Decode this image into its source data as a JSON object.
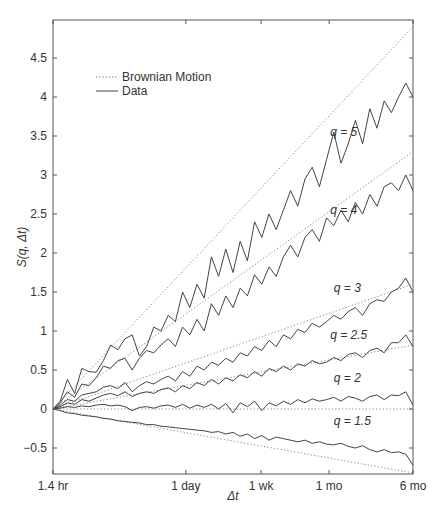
{
  "chart_data": {
    "type": "line",
    "title": "",
    "xlabel": "Δt",
    "ylabel": "S(q, Δt)",
    "xscale": "log",
    "xticks": [
      {
        "label": "1.4 hr",
        "pos": 0.0
      },
      {
        "label": "1 day",
        "pos": 0.369
      },
      {
        "label": "1 wk",
        "pos": 0.578
      },
      {
        "label": "1 mo",
        "pos": 0.767
      },
      {
        "label": "6 mo",
        "pos": 1.0
      }
    ],
    "yticks": [
      -0.5,
      0,
      0.5,
      1,
      1.5,
      2,
      2.5,
      3,
      3.5,
      4,
      4.5
    ],
    "ylim": [
      -0.83,
      4.95
    ],
    "grid": false,
    "legend": {
      "position": "upper left",
      "entries": [
        {
          "label": "Brownian Motion",
          "style": "dotted"
        },
        {
          "label": "Data",
          "style": "solid"
        }
      ]
    },
    "brownian_motion": [
      {
        "q": 5,
        "end": 4.9
      },
      {
        "q": 4,
        "end": 3.3
      },
      {
        "q": 3,
        "end": 1.6
      },
      {
        "q": 2.5,
        "end": 0.82
      },
      {
        "q": 2,
        "end": 0.0
      },
      {
        "q": 1.5,
        "end": -0.82
      }
    ],
    "series": [
      {
        "name": "q = 5",
        "label": "q = 5",
        "label_pos": [
          0.77,
          3.5
        ],
        "x": [
          0,
          0.02,
          0.04,
          0.06,
          0.08,
          0.1,
          0.12,
          0.14,
          0.16,
          0.18,
          0.2,
          0.22,
          0.24,
          0.26,
          0.28,
          0.3,
          0.32,
          0.34,
          0.36,
          0.38,
          0.4,
          0.42,
          0.44,
          0.46,
          0.48,
          0.5,
          0.52,
          0.54,
          0.56,
          0.58,
          0.6,
          0.62,
          0.64,
          0.66,
          0.68,
          0.7,
          0.72,
          0.74,
          0.76,
          0.78,
          0.8,
          0.82,
          0.84,
          0.86,
          0.88,
          0.9,
          0.92,
          0.94,
          0.96,
          0.98,
          1.0
        ],
        "values": [
          0,
          0.1,
          0.38,
          0.2,
          0.52,
          0.48,
          0.47,
          0.62,
          0.82,
          0.76,
          0.9,
          0.95,
          0.68,
          0.8,
          1.05,
          1.0,
          1.2,
          1.12,
          1.5,
          1.3,
          1.6,
          1.42,
          1.95,
          1.7,
          2.05,
          1.75,
          2.15,
          1.9,
          2.4,
          2.2,
          2.5,
          2.3,
          2.55,
          2.8,
          2.6,
          2.95,
          3.1,
          2.85,
          3.2,
          3.55,
          3.15,
          3.4,
          3.7,
          3.4,
          3.85,
          3.6,
          3.95,
          3.8,
          4.0,
          4.18,
          4.0
        ]
      },
      {
        "name": "q = 4",
        "label": "q = 4",
        "label_pos": [
          0.77,
          2.5
        ],
        "x": [
          0,
          0.02,
          0.04,
          0.06,
          0.08,
          0.1,
          0.12,
          0.14,
          0.16,
          0.18,
          0.2,
          0.22,
          0.24,
          0.26,
          0.28,
          0.3,
          0.32,
          0.34,
          0.36,
          0.38,
          0.4,
          0.42,
          0.44,
          0.46,
          0.48,
          0.5,
          0.52,
          0.54,
          0.56,
          0.58,
          0.6,
          0.62,
          0.64,
          0.66,
          0.68,
          0.7,
          0.72,
          0.74,
          0.76,
          0.78,
          0.8,
          0.82,
          0.84,
          0.86,
          0.88,
          0.9,
          0.92,
          0.94,
          0.96,
          0.98,
          1.0
        ],
        "values": [
          0,
          0.08,
          0.22,
          0.15,
          0.32,
          0.3,
          0.4,
          0.55,
          0.52,
          0.62,
          0.65,
          0.5,
          0.65,
          0.75,
          0.72,
          0.82,
          0.9,
          0.8,
          1.05,
          0.95,
          1.15,
          1.0,
          1.35,
          1.2,
          1.45,
          1.3,
          1.55,
          1.45,
          1.72,
          1.6,
          1.82,
          1.7,
          1.95,
          2.1,
          1.95,
          2.2,
          2.3,
          2.15,
          2.45,
          2.35,
          2.55,
          2.4,
          2.65,
          2.5,
          2.75,
          2.6,
          2.85,
          2.9,
          2.8,
          3.0,
          2.8
        ]
      },
      {
        "name": "q = 3",
        "label": "q = 3",
        "label_pos": [
          0.78,
          1.5
        ],
        "x": [
          0,
          0.02,
          0.04,
          0.06,
          0.08,
          0.1,
          0.12,
          0.14,
          0.16,
          0.18,
          0.2,
          0.22,
          0.24,
          0.26,
          0.28,
          0.3,
          0.32,
          0.34,
          0.36,
          0.38,
          0.4,
          0.42,
          0.44,
          0.46,
          0.48,
          0.5,
          0.52,
          0.54,
          0.56,
          0.58,
          0.6,
          0.62,
          0.64,
          0.66,
          0.68,
          0.7,
          0.72,
          0.74,
          0.76,
          0.78,
          0.8,
          0.82,
          0.84,
          0.86,
          0.88,
          0.9,
          0.92,
          0.94,
          0.96,
          0.98,
          1.0
        ],
        "values": [
          0,
          0.05,
          0.12,
          0.1,
          0.18,
          0.2,
          0.22,
          0.28,
          0.3,
          0.26,
          0.34,
          0.22,
          0.3,
          0.35,
          0.32,
          0.38,
          0.42,
          0.36,
          0.48,
          0.42,
          0.55,
          0.5,
          0.6,
          0.56,
          0.65,
          0.6,
          0.72,
          0.68,
          0.8,
          0.75,
          0.88,
          0.8,
          0.95,
          0.9,
          1.02,
          0.98,
          1.1,
          1.05,
          1.12,
          1.2,
          1.15,
          1.25,
          1.3,
          1.2,
          1.35,
          1.4,
          1.38,
          1.5,
          1.55,
          1.68,
          1.5
        ]
      },
      {
        "name": "q = 2.5",
        "label": "q = 2.5",
        "label_pos": [
          0.77,
          0.9
        ],
        "x": [
          0,
          0.02,
          0.04,
          0.06,
          0.08,
          0.1,
          0.12,
          0.14,
          0.16,
          0.18,
          0.2,
          0.22,
          0.24,
          0.26,
          0.28,
          0.3,
          0.32,
          0.34,
          0.36,
          0.38,
          0.4,
          0.42,
          0.44,
          0.46,
          0.48,
          0.5,
          0.52,
          0.54,
          0.56,
          0.58,
          0.6,
          0.62,
          0.64,
          0.66,
          0.68,
          0.7,
          0.72,
          0.74,
          0.76,
          0.78,
          0.8,
          0.82,
          0.84,
          0.86,
          0.88,
          0.9,
          0.92,
          0.94,
          0.96,
          0.98,
          1.0
        ],
        "values": [
          0,
          0.03,
          0.08,
          0.06,
          0.12,
          0.1,
          0.14,
          0.18,
          0.2,
          0.17,
          0.22,
          0.16,
          0.2,
          0.22,
          0.2,
          0.25,
          0.27,
          0.22,
          0.3,
          0.26,
          0.34,
          0.3,
          0.38,
          0.32,
          0.4,
          0.36,
          0.44,
          0.4,
          0.48,
          0.42,
          0.52,
          0.48,
          0.55,
          0.5,
          0.58,
          0.55,
          0.62,
          0.58,
          0.6,
          0.66,
          0.62,
          0.7,
          0.72,
          0.66,
          0.75,
          0.78,
          0.72,
          0.85,
          0.85,
          0.95,
          0.8
        ]
      },
      {
        "name": "q = 2",
        "label": "q = 2",
        "label_pos": [
          0.78,
          0.35
        ],
        "x": [
          0,
          0.02,
          0.04,
          0.06,
          0.08,
          0.1,
          0.12,
          0.14,
          0.16,
          0.18,
          0.2,
          0.22,
          0.24,
          0.26,
          0.28,
          0.3,
          0.32,
          0.34,
          0.36,
          0.38,
          0.4,
          0.42,
          0.44,
          0.46,
          0.48,
          0.5,
          0.52,
          0.54,
          0.56,
          0.58,
          0.6,
          0.62,
          0.64,
          0.66,
          0.68,
          0.7,
          0.72,
          0.74,
          0.76,
          0.78,
          0.8,
          0.82,
          0.84,
          0.86,
          0.88,
          0.9,
          0.92,
          0.94,
          0.96,
          0.98,
          1.0
        ],
        "values": [
          0,
          0.01,
          0.03,
          0.02,
          0.04,
          0.03,
          0.05,
          0.06,
          0.04,
          0.05,
          0.03,
          -0.02,
          0.02,
          0.03,
          0.01,
          0.04,
          0.05,
          0.02,
          0.06,
          0.01,
          0.05,
          0.02,
          0.06,
          0.0,
          0.07,
          -0.05,
          0.08,
          0.03,
          0.1,
          -0.02,
          0.08,
          0.04,
          0.1,
          0.06,
          0.12,
          0.08,
          0.13,
          0.1,
          0.12,
          0.15,
          0.1,
          0.16,
          0.14,
          0.1,
          0.16,
          0.18,
          0.12,
          0.18,
          0.17,
          0.22,
          0.05
        ]
      },
      {
        "name": "q = 1.5",
        "label": "q = 1.5",
        "label_pos": [
          0.78,
          -0.2
        ],
        "x": [
          0,
          0.02,
          0.04,
          0.06,
          0.08,
          0.1,
          0.12,
          0.14,
          0.16,
          0.18,
          0.2,
          0.22,
          0.24,
          0.26,
          0.28,
          0.3,
          0.32,
          0.34,
          0.36,
          0.38,
          0.4,
          0.42,
          0.44,
          0.46,
          0.48,
          0.5,
          0.52,
          0.54,
          0.56,
          0.58,
          0.6,
          0.62,
          0.64,
          0.66,
          0.68,
          0.7,
          0.72,
          0.74,
          0.76,
          0.78,
          0.8,
          0.82,
          0.84,
          0.86,
          0.88,
          0.9,
          0.92,
          0.94,
          0.96,
          0.98,
          1.0
        ],
        "values": [
          0,
          -0.02,
          -0.05,
          -0.06,
          -0.08,
          -0.09,
          -0.1,
          -0.12,
          -0.13,
          -0.15,
          -0.16,
          -0.17,
          -0.18,
          -0.2,
          -0.2,
          -0.22,
          -0.23,
          -0.24,
          -0.25,
          -0.26,
          -0.27,
          -0.28,
          -0.3,
          -0.29,
          -0.32,
          -0.3,
          -0.35,
          -0.32,
          -0.38,
          -0.34,
          -0.4,
          -0.36,
          -0.38,
          -0.4,
          -0.42,
          -0.4,
          -0.44,
          -0.42,
          -0.45,
          -0.46,
          -0.44,
          -0.48,
          -0.5,
          -0.47,
          -0.52,
          -0.55,
          -0.52,
          -0.56,
          -0.55,
          -0.58,
          -0.72
        ]
      }
    ]
  }
}
